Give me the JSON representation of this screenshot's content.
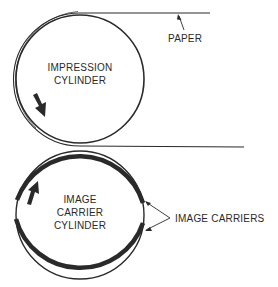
{
  "diagram": {
    "labels": {
      "paper": "PAPER",
      "impression_line1": "IMPRESSION",
      "impression_line2": "CYLINDER",
      "carrier_line1": "IMAGE",
      "carrier_line2": "CARRIER",
      "carrier_line3": "CYLINDER",
      "image_carriers": "IMAGE CARRIERS"
    },
    "colors": {
      "ink": "#2a2a2a",
      "background": "#ffffff"
    },
    "components": [
      {
        "name": "impression-cylinder",
        "rotation": "counter-clockwise"
      },
      {
        "name": "image-carrier-cylinder",
        "rotation": "clockwise"
      },
      {
        "name": "paper",
        "path": "wraps around left side of impression cylinder, passes through nip"
      },
      {
        "name": "image-carriers",
        "count": 2
      }
    ]
  }
}
